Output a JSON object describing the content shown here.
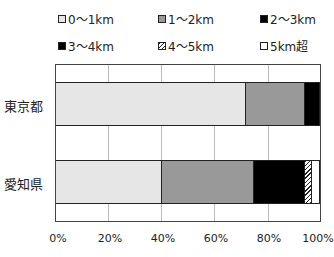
{
  "title_partial": "図表 1 通勤・通学時の移動距離別分布",
  "chart_data": {
    "type": "bar",
    "orientation": "horizontal",
    "stacked": true,
    "percent": true,
    "categories": [
      "東京都",
      "愛知県"
    ],
    "series": [
      {
        "name": "0〜1km",
        "color": "#e6e6e6",
        "pattern": "solid",
        "values": [
          72,
          40
        ]
      },
      {
        "name": "1〜2km",
        "color": "#999999",
        "pattern": "solid",
        "values": [
          22.5,
          35
        ]
      },
      {
        "name": "2〜3km",
        "color": "#000000",
        "pattern": "solid",
        "values": [
          5.5,
          19.5
        ]
      },
      {
        "name": "3〜4km",
        "color": "#000000",
        "pattern": "solid",
        "values": [
          0,
          0
        ]
      },
      {
        "name": "4〜5km",
        "color": "#ffffff",
        "pattern": "hatch",
        "values": [
          0,
          2.5
        ]
      },
      {
        "name": "5km超",
        "color": "#ffffff",
        "pattern": "solid",
        "values": [
          0,
          3
        ]
      }
    ],
    "xlabel": "",
    "ylabel": "",
    "xlim": [
      0,
      100
    ],
    "xticks": [
      "0%",
      "20%",
      "40%",
      "60%",
      "80%",
      "100%"
    ],
    "grid": true,
    "legend_position": "top"
  },
  "legend": [
    {
      "label": "0〜1km",
      "color": "#e6e6e6",
      "pattern": "solid"
    },
    {
      "label": "1〜2km",
      "color": "#999999",
      "pattern": "solid"
    },
    {
      "label": "2〜3km",
      "color": "#000000",
      "pattern": "solid"
    },
    {
      "label": "3〜4km",
      "color": "#000000",
      "pattern": "solid"
    },
    {
      "label": "4〜5km",
      "color": "#ffffff",
      "pattern": "hatch"
    },
    {
      "label": "5km超",
      "color": "#ffffff",
      "pattern": "solid"
    }
  ],
  "yaxis": {
    "labels": [
      "東京都",
      "愛知県"
    ]
  },
  "xaxis": {
    "ticks": [
      "0%",
      "20%",
      "40%",
      "60%",
      "80%",
      "100%"
    ]
  }
}
